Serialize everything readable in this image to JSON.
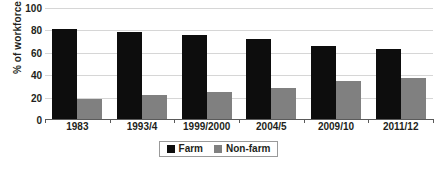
{
  "chart_data": {
    "type": "bar",
    "title": "",
    "subtitle": "",
    "xlabel": "",
    "ylabel": "% of workforce",
    "categories": [
      "1983",
      "1993/4",
      "1999/2000",
      "2004/5",
      "2009/10",
      "2011/12"
    ],
    "series": [
      {
        "name": "Farm",
        "color": "#0d0d0d",
        "values": [
          81,
          78.5,
          76,
          72.5,
          66.5,
          63
        ]
      },
      {
        "name": "Non-farm",
        "color": "#808080",
        "values": [
          19,
          22,
          25,
          28.5,
          34.5,
          37.5
        ]
      }
    ],
    "ylim": [
      0,
      100
    ],
    "yticks": [
      0,
      20,
      40,
      60,
      80,
      100
    ],
    "ytick_labels": [
      "0",
      "20",
      "40",
      "60",
      "80",
      "100"
    ],
    "grid": true,
    "grid_axis": "y",
    "legend_position": "bottom"
  },
  "legend": {
    "entries": [
      {
        "label": "Farm"
      },
      {
        "label": "Non-farm"
      }
    ]
  },
  "colors": {
    "farm": "#0d0d0d",
    "nonfarm": "#808080",
    "gridline": "#d6d6d6",
    "axis": "#5a5a5a",
    "text": "#231f20",
    "background": "#ffffff"
  }
}
